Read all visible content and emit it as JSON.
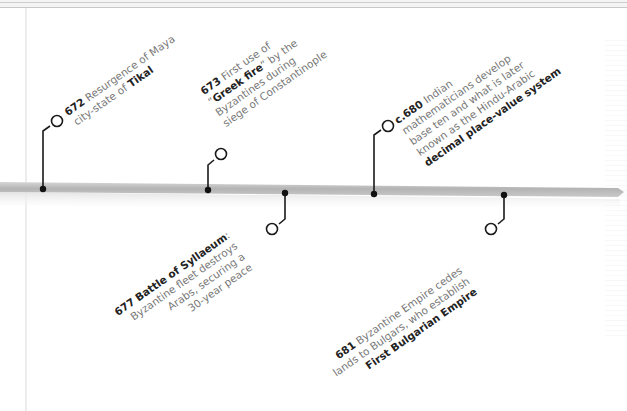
{
  "timeline": {
    "events": [
      {
        "year": "672",
        "lines": [
          {
            "pre": "Resurgence of Maya",
            "bold": "",
            "post": ""
          },
          {
            "pre": "city-state of ",
            "bold": "Tikal",
            "post": ""
          }
        ],
        "side": "above"
      },
      {
        "year": "673",
        "lines": [
          {
            "pre": "First use of",
            "bold": "",
            "post": ""
          },
          {
            "pre": "“",
            "bold": "Greek fire",
            "post": "” by the"
          },
          {
            "pre": "Byzantines during",
            "bold": "",
            "post": ""
          },
          {
            "pre": "siege of Constantinople",
            "bold": "",
            "post": ""
          }
        ],
        "side": "above"
      },
      {
        "year": "677",
        "lines": [
          {
            "pre": "",
            "bold": "Battle of Syllaeum",
            "post": ":"
          },
          {
            "pre": "Byzantine fleet destroys",
            "bold": "",
            "post": ""
          },
          {
            "pre": "Arabs, securing a",
            "bold": "",
            "post": ""
          },
          {
            "pre": "30-year peace",
            "bold": "",
            "post": ""
          }
        ],
        "side": "below"
      },
      {
        "year": "c.680",
        "lines": [
          {
            "pre": "Indian",
            "bold": "",
            "post": ""
          },
          {
            "pre": "mathematicians develop",
            "bold": "",
            "post": ""
          },
          {
            "pre": "base ten and what is later",
            "bold": "",
            "post": ""
          },
          {
            "pre": "known as the Hindu-Arabic",
            "bold": "",
            "post": ""
          },
          {
            "pre": "",
            "bold": "decimal place-value system",
            "post": ""
          }
        ],
        "side": "above"
      },
      {
        "year": "681",
        "lines": [
          {
            "pre": "Byzantine Empire cedes",
            "bold": "",
            "post": ""
          },
          {
            "pre": "lands to Bulgars, who establish",
            "bold": "",
            "post": ""
          },
          {
            "pre": "",
            "bold": "First Bulgarian Empire",
            "post": ""
          }
        ],
        "side": "below"
      }
    ],
    "colors": {
      "bar": "#b8b8b8",
      "connector": "#1a1a1a",
      "text": "#777777",
      "text_bold": "#222222"
    }
  }
}
